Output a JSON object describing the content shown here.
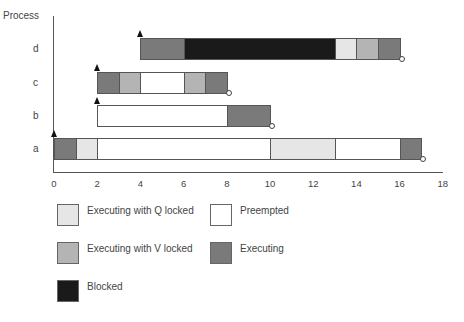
{
  "chart_data": {
    "type": "gantt",
    "title": "",
    "xlabel": "",
    "ylabel": "Process",
    "xlim": [
      0,
      18
    ],
    "x_ticks": [
      "0",
      "2",
      "4",
      "6",
      "8",
      "10",
      "12",
      "14",
      "16",
      "18"
    ],
    "categories": [
      "a",
      "b",
      "c",
      "d"
    ],
    "states": {
      "executing_q": {
        "label": "Executing with Q locked",
        "color": "#e6e6e6"
      },
      "preempted": {
        "label": "Preempted",
        "color": "#ffffff"
      },
      "executing_v": {
        "label": "Executing with V locked",
        "color": "#b4b4b4"
      },
      "executing": {
        "label": "Executing",
        "color": "#7a7a7a"
      },
      "blocked": {
        "label": "Blocked",
        "color": "#1a1a1a"
      }
    },
    "processes": [
      {
        "name": "d",
        "arrival": 4,
        "completion": 16,
        "segments": [
          {
            "start": 4,
            "end": 6,
            "state": "executing"
          },
          {
            "start": 6,
            "end": 13,
            "state": "blocked"
          },
          {
            "start": 13,
            "end": 14,
            "state": "executing_q"
          },
          {
            "start": 14,
            "end": 15,
            "state": "executing_v"
          },
          {
            "start": 15,
            "end": 16,
            "state": "executing"
          }
        ]
      },
      {
        "name": "c",
        "arrival": 2,
        "completion": 8,
        "segments": [
          {
            "start": 2,
            "end": 3,
            "state": "executing"
          },
          {
            "start": 3,
            "end": 4,
            "state": "executing_v"
          },
          {
            "start": 4,
            "end": 6,
            "state": "preempted"
          },
          {
            "start": 6,
            "end": 7,
            "state": "executing_v"
          },
          {
            "start": 7,
            "end": 8,
            "state": "executing"
          }
        ]
      },
      {
        "name": "b",
        "arrival": 2,
        "completion": 10,
        "segments": [
          {
            "start": 2,
            "end": 8,
            "state": "preempted"
          },
          {
            "start": 8,
            "end": 10,
            "state": "executing"
          }
        ]
      },
      {
        "name": "a",
        "arrival": 0,
        "completion": 17,
        "segments": [
          {
            "start": 0,
            "end": 1,
            "state": "executing"
          },
          {
            "start": 1,
            "end": 2,
            "state": "executing_q"
          },
          {
            "start": 2,
            "end": 10,
            "state": "preempted"
          },
          {
            "start": 10,
            "end": 13,
            "state": "executing_q"
          },
          {
            "start": 13,
            "end": 16,
            "state": "preempted"
          },
          {
            "start": 16,
            "end": 17,
            "state": "executing"
          }
        ]
      }
    ],
    "legend": [
      {
        "key": "executing_q",
        "label": "Executing with Q locked"
      },
      {
        "key": "preempted",
        "label": "Preempted"
      },
      {
        "key": "executing_v",
        "label": "Executing with V locked"
      },
      {
        "key": "executing",
        "label": "Executing"
      },
      {
        "key": "blocked",
        "label": "Blocked"
      }
    ],
    "annotations": [
      "▲ arrival marker at start of each process",
      "○ completion marker at end of each process"
    ]
  },
  "axis": {
    "y_title": "Process",
    "rows": {
      "d": "d",
      "c": "c",
      "b": "b",
      "a": "a"
    }
  },
  "legend": {
    "q_locked": "Executing with Q locked",
    "preempted": "Preempted",
    "v_locked": "Executing with V locked",
    "executing": "Executing",
    "blocked": "Blocked"
  }
}
